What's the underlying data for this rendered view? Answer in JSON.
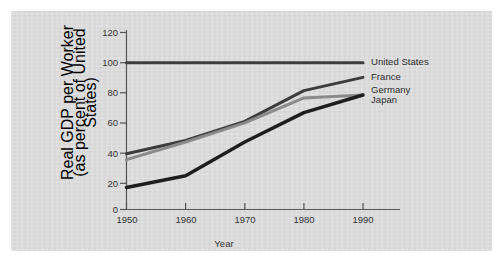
{
  "figure": {
    "background_color": "#d9d9d9",
    "page_color": "#ffffff",
    "axis_color": "#4a4a4a",
    "text_color": "#333333"
  },
  "chart_data": {
    "type": "line",
    "title": "",
    "xlabel": "Year",
    "ylabel": "Real GDP per Worker (as percent of United States)",
    "ylabel_line1": "Real GDP per Worker",
    "ylabel_line2": "(as percent of United States)",
    "x": [
      1950,
      1960,
      1970,
      1980,
      1990
    ],
    "xlim": [
      1950,
      1992
    ],
    "ylim": [
      0,
      125
    ],
    "xticks": [
      "1950",
      "1960",
      "1970",
      "1980",
      "1990"
    ],
    "yticks": [
      "0",
      "20",
      "40",
      "60",
      "80",
      "100",
      "120"
    ],
    "ytick_values": [
      0,
      20,
      40,
      60,
      80,
      100,
      120
    ],
    "grid": false,
    "legend_position": "right-inline",
    "series": [
      {
        "name": "United States",
        "color": "#3c3c3c",
        "width": 3.0,
        "values": [
          100,
          100,
          100,
          100,
          100
        ],
        "label_value": 100
      },
      {
        "name": "France",
        "color": "#3c3c3c",
        "width": 3.0,
        "values": [
          38,
          47,
          60,
          81,
          90
        ],
        "label_value": 90
      },
      {
        "name": "Germany",
        "color": "#8a8a8a",
        "width": 3.0,
        "values": [
          34,
          46,
          59,
          76,
          78
        ],
        "label_value": 78
      },
      {
        "name": "Japan",
        "color": "#1e1e1e",
        "width": 3.4,
        "values": [
          15,
          23,
          46,
          66,
          78
        ],
        "label_value": 78
      }
    ]
  },
  "legend": {
    "entries": [
      {
        "label": "United States"
      },
      {
        "label": "France"
      },
      {
        "label": "Germany"
      },
      {
        "label": "Japan"
      }
    ]
  }
}
